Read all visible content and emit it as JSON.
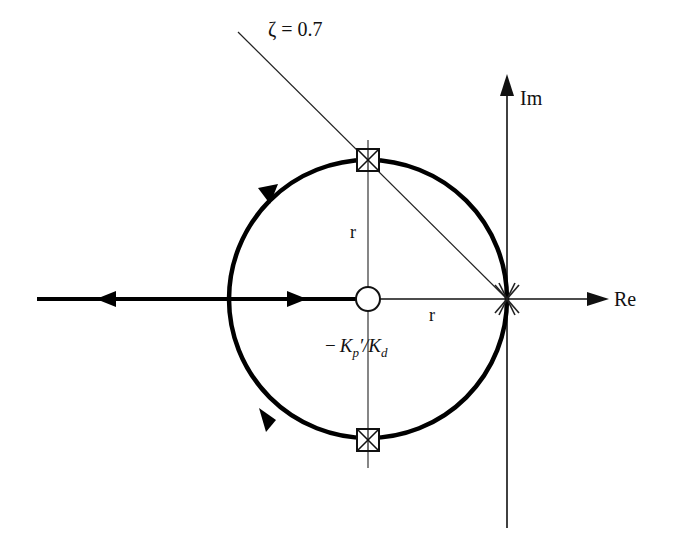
{
  "diagram": {
    "type": "root-locus",
    "damping_line_label": "ζ = 0.7",
    "imag_axis_label": "Im",
    "real_axis_label": "Re",
    "radius_label_vertical": "r",
    "radius_label_horizontal": "r",
    "zero_label_parts": [
      "−",
      "K",
      "p",
      "′/",
      "K",
      "d"
    ],
    "zero_label": "−Kp′/Kd",
    "markers": [
      {
        "kind": "double-pole",
        "location": "origin",
        "glyph": "double-cross"
      },
      {
        "kind": "closed-loop-pole",
        "location": "upper",
        "glyph": "boxed-x"
      },
      {
        "kind": "closed-loop-pole",
        "location": "lower",
        "glyph": "boxed-x"
      },
      {
        "kind": "zero",
        "location": "circle-center",
        "glyph": "open-circle"
      }
    ],
    "colors": {
      "stroke": "#111111",
      "background": "#ffffff"
    }
  }
}
